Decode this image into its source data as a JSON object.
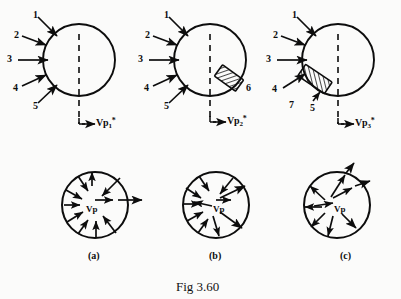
{
  "figure": {
    "caption": "Fig 3.60",
    "panels": [
      {
        "key": "a",
        "subcaption": "(a)",
        "velocity_label_text": "Vp",
        "velocity_label_sub": "1",
        "velocity_label_sup": "*",
        "callouts": [
          "1",
          "2",
          "3",
          "4",
          "5"
        ],
        "lower_velocity_label": "Vp",
        "flow_pattern": "converging-inward",
        "has_hatched_block": false
      },
      {
        "key": "b",
        "subcaption": "(b)",
        "velocity_label_text": "Vp",
        "velocity_label_sub": "2",
        "velocity_label_sup": "*",
        "callouts": [
          "1",
          "2",
          "3",
          "4",
          "5",
          "6"
        ],
        "lower_velocity_label": "Vp",
        "flow_pattern": "mixed-converging-diverging",
        "has_hatched_block": true,
        "hatched_block_label": "6",
        "hatched_block_position": "lower-right"
      },
      {
        "key": "c",
        "subcaption": "(c)",
        "velocity_label_text": "Vp",
        "velocity_label_sub": "3",
        "velocity_label_sup": "*",
        "callouts": [
          "1",
          "2",
          "3",
          "4",
          "5",
          "7"
        ],
        "lower_velocity_label": "Vp",
        "flow_pattern": "diverging-outward",
        "has_hatched_block": true,
        "hatched_block_label": "7",
        "hatched_block_position": "lower-left"
      }
    ]
  },
  "colors": {
    "ink": "#0d0d0d",
    "page": "#fbfbfa"
  }
}
